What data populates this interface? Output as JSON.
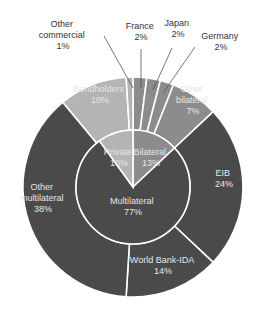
{
  "chart_data": {
    "type": "pie",
    "subtype": "nested-donut (sunburst)",
    "title": "",
    "inner_ring": {
      "categories": [
        "Bilateral",
        "Multilateral",
        "Private"
      ],
      "values": [
        13,
        77,
        10
      ],
      "labels": [
        "Bilateral\n13%",
        "Multilateral\n77%",
        "Private\n10%"
      ]
    },
    "outer_ring": {
      "categories": [
        "France",
        "Japan",
        "Germany",
        "Other bilateral",
        "EIB",
        "World Bank-IDA",
        "Other multilateral",
        "Bondholders",
        "Other commercial"
      ],
      "values": [
        2,
        2,
        2,
        7,
        24,
        14,
        38,
        10,
        1
      ],
      "parent": [
        "Bilateral",
        "Bilateral",
        "Bilateral",
        "Bilateral",
        "Multilateral",
        "Multilateral",
        "Multilateral",
        "Private",
        "Private"
      ]
    },
    "colors": {
      "bilateral": "#8c8c8c",
      "multilateral": "#4a4a4a",
      "private": "#b4b4b4",
      "separator": "#ffffff"
    },
    "legend": "none (direct labels)",
    "grid": false
  },
  "labels": {
    "france": {
      "name": "France",
      "pct": "2%"
    },
    "japan": {
      "name": "Japan",
      "pct": "2%"
    },
    "germany": {
      "name": "Germany",
      "pct": "2%"
    },
    "other_commercial": {
      "line1": "Other",
      "line2": "commercial",
      "pct": "1%"
    },
    "other_bilateral": {
      "line1": "Other",
      "line2": "bilateral",
      "pct": "7%"
    },
    "bondholders": {
      "name": "Bondholders",
      "pct": "10%"
    },
    "eib": {
      "name": "EIB",
      "pct": "24%"
    },
    "world_bank": {
      "name": "World Bank-IDA",
      "pct": "14%"
    },
    "other_multilateral": {
      "line1": "Other",
      "line2": "multilateral",
      "pct": "38%"
    },
    "private": {
      "name": "Private",
      "pct": "10%"
    },
    "bilateral": {
      "name": "Bilateral",
      "pct": "13%"
    },
    "multilateral": {
      "name": "Multilateral",
      "pct": "77%"
    }
  }
}
